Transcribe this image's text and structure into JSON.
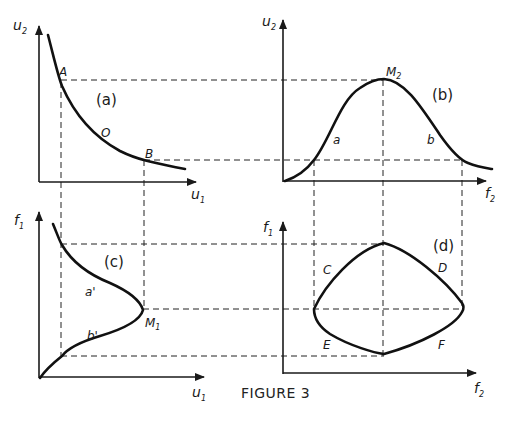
{
  "figure": {
    "caption": "FIGURE 3",
    "panels": {
      "a": {
        "label": "(a)",
        "x_axis": "u",
        "x_axis_sub": "1",
        "y_axis": "u",
        "y_axis_sub": "2",
        "points": [
          "A",
          "O",
          "B"
        ]
      },
      "b": {
        "label": "(b)",
        "x_axis": "f",
        "x_axis_sub": "2",
        "y_axis": "u",
        "y_axis_sub": "2",
        "peak": "M",
        "peak_sub": "2",
        "points": [
          "a",
          "b"
        ]
      },
      "c": {
        "label": "(c)",
        "x_axis": "u",
        "x_axis_sub": "1",
        "y_axis": "f",
        "y_axis_sub": "1",
        "peak": "M",
        "peak_sub": "1",
        "points": [
          "a'",
          "b'"
        ]
      },
      "d": {
        "label": "(d)",
        "x_axis": "f",
        "x_axis_sub": "2",
        "y_axis": "f",
        "y_axis_sub": "1",
        "points": [
          "C",
          "D",
          "E",
          "F"
        ]
      }
    }
  }
}
